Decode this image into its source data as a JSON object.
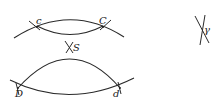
{
  "diagram": {
    "labels": {
      "c": "c",
      "C": "C",
      "S": "S",
      "D": "D",
      "d": "d",
      "gamma": "γ"
    },
    "stroke_color": "#2a2a2a",
    "background": "#ffffff"
  }
}
